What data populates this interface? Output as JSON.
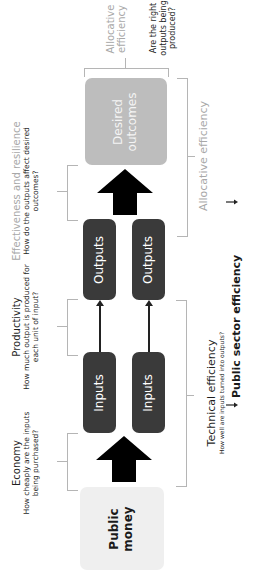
{
  "orientation": "rotated-90-ccw",
  "boxes": {
    "public_money": "Public money",
    "public_money_lines": [
      "Public",
      "money"
    ],
    "inputs_1": "Inputs",
    "inputs_2": "Inputs",
    "outputs_1": "Outputs",
    "outputs_2": "Outputs",
    "desired_outcomes_lines": [
      "Desired",
      "outcomes"
    ]
  },
  "annotations": {
    "economy": {
      "title": "Economy",
      "question_lines": [
        "How cheaply are the inputs",
        "being purchased?"
      ]
    },
    "productivity": {
      "title": "Productivity",
      "question_lines": [
        "How much output is produced for",
        "each unit of input?"
      ]
    },
    "effectiveness": {
      "title": "Effectiveness and resilience",
      "question_lines": [
        "How do the outputs affect desired",
        "outcomes?"
      ]
    },
    "allocative_top": {
      "title_lines": [
        "Allocative",
        "efficiency"
      ],
      "question_lines": [
        "Are the right",
        "outputs being",
        "produced?"
      ]
    },
    "technical": {
      "title": "Technical efficiency",
      "question": "How well are inputs turned into outputs?"
    },
    "allocative_right": {
      "title": "Allocative efficiency"
    },
    "public_sector": {
      "title": "Public sector efficiency"
    }
  },
  "colors": {
    "dark_box": "#3a3a3a",
    "grey_box": "#bdbdbd",
    "light_box": "#efefef",
    "grey_text": "#a8a8a8",
    "bracket": "#b5b5b5"
  }
}
